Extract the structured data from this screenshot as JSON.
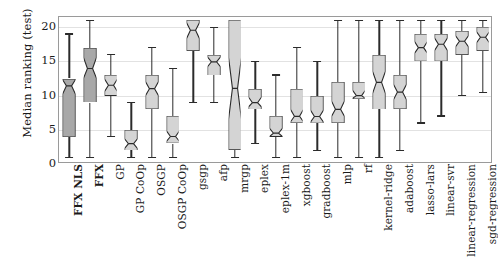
{
  "chart_data": {
    "type": "box",
    "title": "",
    "xlabel": "",
    "ylabel": "Median ranking (test)",
    "ylim": [
      0,
      21.5
    ],
    "yticks": [
      0,
      5,
      10,
      15,
      20
    ],
    "ytick_labels": [
      "0",
      "5",
      "10",
      "15",
      "20"
    ],
    "grid": true,
    "legend": "none",
    "notched": true,
    "categories": [
      "FFX NLS",
      "FFX",
      "GP",
      "GP CoOp",
      "OSGP",
      "OSGP CoOp",
      "gsgp",
      "afp",
      "mrgp",
      "eplex",
      "eplex-1m",
      "xgboost",
      "gradboost",
      "mlp",
      "rf",
      "kernel-ridge",
      "adaboost",
      "lasso-lars",
      "linear-svr",
      "linear-regression",
      "sgd-regression"
    ],
    "emphasized_categories": [
      "FFX NLS",
      "FFX"
    ],
    "boxes": [
      {
        "label": "FFX NLS",
        "whisker_low": 1.0,
        "q1": 4.0,
        "median": 11.5,
        "q3": 12.5,
        "whisker_high": 19.0,
        "notch_low": 10.3,
        "notch_high": 12.4,
        "fill": "#a8a8a8"
      },
      {
        "label": "FFX",
        "whisker_low": 1.0,
        "q1": 9.0,
        "median": 14.0,
        "q3": 17.0,
        "whisker_high": 21.0,
        "notch_low": 12.6,
        "notch_high": 15.6,
        "fill": "#a8a8a8"
      },
      {
        "label": "GP",
        "whisker_low": 4.0,
        "q1": 10.0,
        "median": 11.5,
        "q3": 13.0,
        "whisker_high": 16.0,
        "notch_low": 10.6,
        "notch_high": 12.4,
        "fill": "#d4d4d4"
      },
      {
        "label": "GP CoOp",
        "whisker_low": 1.0,
        "q1": 2.0,
        "median": 3.0,
        "q3": 5.0,
        "whisker_high": 9.0,
        "notch_low": 2.3,
        "notch_high": 3.7,
        "fill": "#d4d4d4"
      },
      {
        "label": "OSGP",
        "whisker_low": 1.0,
        "q1": 8.0,
        "median": 11.0,
        "q3": 13.0,
        "whisker_high": 17.0,
        "notch_low": 10.0,
        "notch_high": 12.0,
        "fill": "#d4d4d4"
      },
      {
        "label": "OSGP CoOp",
        "whisker_low": 1.0,
        "q1": 3.0,
        "median": 4.0,
        "q3": 7.0,
        "whisker_high": 14.0,
        "notch_low": 3.3,
        "notch_high": 4.8,
        "fill": "#d4d4d4"
      },
      {
        "label": "gsgp",
        "whisker_low": 9.0,
        "q1": 16.5,
        "median": 19.5,
        "q3": 21.0,
        "whisker_high": 21.0,
        "notch_low": 18.3,
        "notch_high": 20.6,
        "fill": "#d4d4d4"
      },
      {
        "label": "afp",
        "whisker_low": 9.0,
        "q1": 13.0,
        "median": 15.0,
        "q3": 16.0,
        "whisker_high": 20.0,
        "notch_low": 14.3,
        "notch_high": 15.7,
        "fill": "#d4d4d4"
      },
      {
        "label": "mrgp",
        "whisker_low": 1.0,
        "q1": 2.0,
        "median": 11.0,
        "q3": 21.0,
        "whisker_high": 21.0,
        "notch_low": 6.5,
        "notch_high": 15.5,
        "fill": "#d4d4d4"
      },
      {
        "label": "eplex",
        "whisker_low": 3.0,
        "q1": 8.0,
        "median": 9.0,
        "q3": 11.0,
        "whisker_high": 15.0,
        "notch_low": 8.4,
        "notch_high": 9.8,
        "fill": "#d4d4d4"
      },
      {
        "label": "eplex-1m",
        "whisker_low": 1.0,
        "q1": 4.0,
        "median": 4.5,
        "q3": 7.0,
        "whisker_high": 13.0,
        "notch_low": 3.9,
        "notch_high": 5.2,
        "fill": "#d4d4d4"
      },
      {
        "label": "xgboost",
        "whisker_low": 1.0,
        "q1": 6.0,
        "median": 7.0,
        "q3": 11.0,
        "whisker_high": 17.0,
        "notch_low": 6.2,
        "notch_high": 8.0,
        "fill": "#d4d4d4"
      },
      {
        "label": "gradboost",
        "whisker_low": 2.0,
        "q1": 6.0,
        "median": 7.0,
        "q3": 10.0,
        "whisker_high": 15.0,
        "notch_low": 6.2,
        "notch_high": 7.9,
        "fill": "#d4d4d4"
      },
      {
        "label": "mlp",
        "whisker_low": 1.0,
        "q1": 6.0,
        "median": 8.0,
        "q3": 12.0,
        "whisker_high": 21.0,
        "notch_low": 7.0,
        "notch_high": 9.2,
        "fill": "#d4d4d4"
      },
      {
        "label": "rf",
        "whisker_low": 1.0,
        "q1": 9.5,
        "median": 10.0,
        "q3": 12.0,
        "whisker_high": 21.0,
        "notch_low": 9.6,
        "notch_high": 10.8,
        "fill": "#d4d4d4"
      },
      {
        "label": "kernel-ridge",
        "whisker_low": 1.0,
        "q1": 8.0,
        "median": 12.0,
        "q3": 16.0,
        "whisker_high": 21.0,
        "notch_low": 10.4,
        "notch_high": 13.6,
        "fill": "#d4d4d4"
      },
      {
        "label": "adaboost",
        "whisker_low": 2.0,
        "q1": 8.0,
        "median": 10.5,
        "q3": 13.0,
        "whisker_high": 21.0,
        "notch_low": 9.4,
        "notch_high": 11.6,
        "fill": "#d4d4d4"
      },
      {
        "label": "lasso-lars",
        "whisker_low": 6.0,
        "q1": 15.0,
        "median": 17.0,
        "q3": 19.0,
        "whisker_high": 21.0,
        "notch_low": 16.2,
        "notch_high": 17.9,
        "fill": "#d4d4d4"
      },
      {
        "label": "linear-svr",
        "whisker_low": 7.0,
        "q1": 15.0,
        "median": 17.5,
        "q3": 19.0,
        "whisker_high": 21.0,
        "notch_low": 16.6,
        "notch_high": 18.4,
        "fill": "#d4d4d4"
      },
      {
        "label": "linear-regression",
        "whisker_low": 10.0,
        "q1": 16.0,
        "median": 18.0,
        "q3": 19.5,
        "whisker_high": 21.0,
        "notch_low": 17.2,
        "notch_high": 18.8,
        "fill": "#d4d4d4"
      },
      {
        "label": "sgd-regression",
        "whisker_low": 10.5,
        "q1": 16.5,
        "median": 18.5,
        "q3": 20.0,
        "whisker_high": 21.0,
        "notch_low": 17.7,
        "notch_high": 19.3,
        "fill": "#d4d4d4"
      }
    ]
  },
  "colors": {
    "box_fill_default": "#d4d4d4",
    "box_fill_highlight": "#a8a8a8",
    "box_edge": "#2b2b2b",
    "grid": "#e2e2e2",
    "frame": "#9a9a9a",
    "text": "#1a1a1a"
  }
}
